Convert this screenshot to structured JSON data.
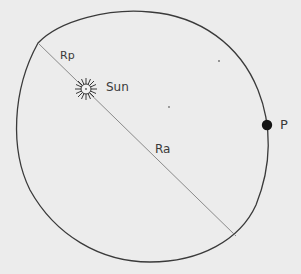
{
  "diagram": {
    "style": "hand-drawn pencil sketch",
    "colors": {
      "background": "#ececec",
      "ink": "#3a3a3a",
      "axis_line": "#8a8a8a",
      "planet": "#151515"
    },
    "labels": {
      "perihelion_distance": "Rp",
      "sun": "Sun",
      "aphelion_distance": "Ra",
      "planet": "P"
    },
    "elements": {
      "orbit": {
        "shape": "ellipse",
        "cx": 142,
        "cy": 137,
        "rx": 126,
        "ry": 128,
        "rotation_deg": -20
      },
      "major_axis": {
        "x1": 38,
        "y1": 43,
        "x2": 236,
        "y2": 236
      },
      "sun": {
        "cx": 86,
        "cy": 89,
        "r": 5,
        "rays": 16
      },
      "planet": {
        "cx": 267,
        "cy": 125,
        "r": 5
      }
    }
  }
}
